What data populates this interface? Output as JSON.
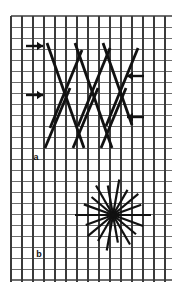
{
  "figure": {
    "width": 182,
    "height": 293,
    "background_color": "#ffffff",
    "ink_color": "#111111",
    "grid_color": "#3a3a3a",
    "grid_light_color": "#6e6e6e"
  },
  "grid": {
    "x": 11,
    "y": 16,
    "width": 161,
    "height": 266,
    "cell_size": 11,
    "columns": 15,
    "rows": 24,
    "vertical_line_width": 1.5,
    "horizontal_line_width": 1.0,
    "border_line_width": 1.6
  },
  "panels": [
    {
      "id": "a",
      "label": "a",
      "label_x": 36,
      "label_y": 160,
      "description": "cross-hatch of long and short diagonal strokes"
    },
    {
      "id": "b",
      "label": "b",
      "label_x": 39,
      "label_y": 257,
      "description": "radial starburst of rays from a single center"
    }
  ],
  "arrows": [
    {
      "name": "arrow-right-upper",
      "direction": "right",
      "x1": 26,
      "y1": 46,
      "x2": 43,
      "y2": 46,
      "glyph": "→"
    },
    {
      "name": "arrow-right-lower",
      "direction": "right",
      "x1": 26,
      "y1": 95,
      "x2": 43,
      "y2": 95,
      "glyph": "→"
    },
    {
      "name": "arrow-left-upper",
      "direction": "left",
      "x1": 144,
      "y1": 76,
      "x2": 127,
      "y2": 76,
      "glyph": "←"
    },
    {
      "name": "arrow-left-lower",
      "direction": "left",
      "x1": 144,
      "y1": 117,
      "x2": 127,
      "y2": 117,
      "glyph": "←"
    }
  ],
  "hatch_long_strokes": [
    {
      "x1": 48,
      "y1": 44,
      "x2": 78,
      "y2": 123,
      "width": 2.6
    },
    {
      "x1": 57,
      "y1": 116,
      "x2": 88,
      "y2": 147,
      "width": 2.6
    },
    {
      "x1": 76,
      "y1": 44,
      "x2": 106,
      "y2": 123,
      "width": 2.6
    },
    {
      "x1": 85,
      "y1": 116,
      "x2": 102,
      "y2": 146,
      "width": 2.6
    },
    {
      "x1": 103,
      "y1": 44,
      "x2": 133,
      "y2": 123,
      "width": 2.6
    },
    {
      "x1": 48,
      "y1": 44,
      "x2": 57,
      "y2": 148,
      "width": 0
    }
  ],
  "hatch_primary": [
    {
      "name": "stroke-down-right-1",
      "x1": 47,
      "y1": 43,
      "x2": 84,
      "y2": 148
    },
    {
      "name": "stroke-down-right-2",
      "x1": 75,
      "y1": 43,
      "x2": 112,
      "y2": 148
    },
    {
      "name": "stroke-down-right-3",
      "x1": 103,
      "y1": 43,
      "x2": 132,
      "y2": 125
    }
  ],
  "hatch_secondary": [
    {
      "name": "stroke-down-left-1",
      "x1": 82,
      "y1": 50,
      "x2": 50,
      "y2": 128
    },
    {
      "name": "stroke-down-left-2",
      "x1": 110,
      "y1": 48,
      "x2": 78,
      "y2": 126
    },
    {
      "name": "stroke-down-left-3",
      "x1": 138,
      "y1": 48,
      "x2": 106,
      "y2": 126
    },
    {
      "name": "stroke-down-left-4",
      "x1": 70,
      "y1": 88,
      "x2": 45,
      "y2": 148
    },
    {
      "name": "stroke-down-left-5",
      "x1": 98,
      "y1": 88,
      "x2": 73,
      "y2": 148
    },
    {
      "name": "stroke-down-left-6",
      "x1": 126,
      "y1": 88,
      "x2": 101,
      "y2": 148
    }
  ],
  "starburst": {
    "name": "starburst",
    "center_x": 113,
    "center_y": 215,
    "ray_count": 18,
    "radius_outer": 38,
    "radius_inner": 28,
    "stroke_width": 2.2,
    "rays": [
      {
        "angle_deg": 0,
        "length": 38
      },
      {
        "angle_deg": 20,
        "length": 30
      },
      {
        "angle_deg": 40,
        "length": 33
      },
      {
        "angle_deg": 60,
        "length": 29
      },
      {
        "angle_deg": 80,
        "length": 36
      },
      {
        "angle_deg": 100,
        "length": 30
      },
      {
        "angle_deg": 120,
        "length": 34
      },
      {
        "angle_deg": 140,
        "length": 28
      },
      {
        "angle_deg": 160,
        "length": 31
      },
      {
        "angle_deg": 180,
        "length": 38
      },
      {
        "angle_deg": 200,
        "length": 29
      },
      {
        "angle_deg": 220,
        "length": 33
      },
      {
        "angle_deg": 240,
        "length": 30
      },
      {
        "angle_deg": 260,
        "length": 36
      },
      {
        "angle_deg": 280,
        "length": 28
      },
      {
        "angle_deg": 300,
        "length": 34
      },
      {
        "angle_deg": 320,
        "length": 30
      },
      {
        "angle_deg": 340,
        "length": 32
      }
    ]
  }
}
